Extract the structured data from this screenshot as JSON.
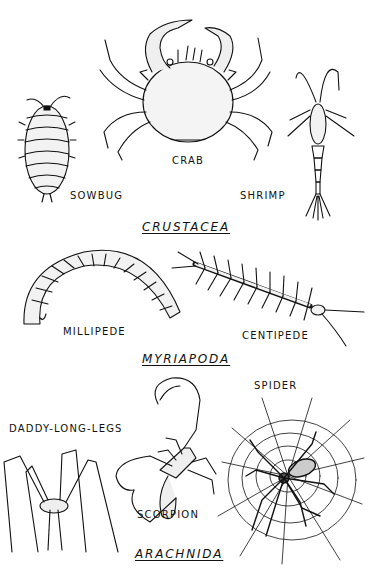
{
  "diagram": {
    "groups": [
      {
        "title": "CRUSTACEA",
        "animals": [
          {
            "name": "SOWBUG"
          },
          {
            "name": "CRAB"
          },
          {
            "name": "SHRIMP"
          }
        ]
      },
      {
        "title": "MYRIAPODA",
        "animals": [
          {
            "name": "MILLIPEDE"
          },
          {
            "name": "CENTIPEDE"
          }
        ]
      },
      {
        "title": "ARACHNIDA",
        "animals": [
          {
            "name": "DADDY-LONG-LEGS"
          },
          {
            "name": "SCORPION"
          },
          {
            "name": "SPIDER"
          }
        ]
      }
    ],
    "ink_color": "#111111",
    "background_color": "#ffffff"
  }
}
